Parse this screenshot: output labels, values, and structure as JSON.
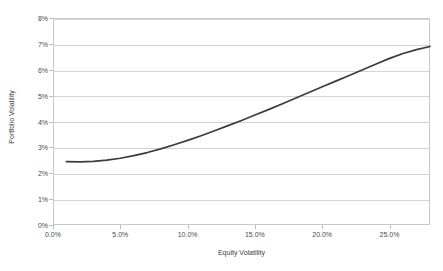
{
  "chart_data": {
    "type": "line",
    "title": "",
    "subtitle": "",
    "xlabel": "Equity Volatility",
    "ylabel": "Portfolio Volatility",
    "xlim": [
      0.0,
      28.0
    ],
    "ylim": [
      0,
      8
    ],
    "x_tick_labels": [
      "0.0%",
      "5.0%",
      "10.0%",
      "15.0%",
      "20.0%",
      "25.0%"
    ],
    "x_tick_values": [
      0.0,
      5.0,
      10.0,
      15.0,
      20.0,
      25.0
    ],
    "y_tick_labels": [
      "0%",
      "1%",
      "2%",
      "3%",
      "4%",
      "5%",
      "6%",
      "7%",
      "8%"
    ],
    "y_tick_values": [
      0,
      1,
      2,
      3,
      4,
      5,
      6,
      7,
      8
    ],
    "grid": "horizontal",
    "legend": "none",
    "series": [
      {
        "name": "Portfolio Volatility",
        "color": "#3b3b3b",
        "x": [
          1.0,
          2.0,
          3.0,
          4.0,
          5.0,
          6.0,
          7.0,
          8.0,
          9.0,
          10.0,
          11.0,
          12.0,
          13.0,
          14.0,
          15.0,
          16.0,
          17.0,
          18.0,
          19.0,
          20.0,
          21.0,
          22.0,
          23.0,
          24.0,
          25.0,
          26.0,
          27.0,
          28.0
        ],
        "values": [
          2.45,
          2.44,
          2.46,
          2.51,
          2.58,
          2.68,
          2.8,
          2.94,
          3.1,
          3.27,
          3.45,
          3.64,
          3.84,
          4.04,
          4.25,
          4.46,
          4.68,
          4.9,
          5.12,
          5.34,
          5.56,
          5.78,
          6.0,
          6.22,
          6.44,
          6.63,
          6.78,
          6.9
        ]
      }
    ],
    "annotations": []
  },
  "axes": {
    "y_title": "Portfolio Volatility",
    "x_title": "Equity Volatility"
  },
  "style": {
    "line_color": "#3b3b3b",
    "grid_color": "#d4d4d4",
    "frame_color": "#c9c9c9",
    "tick_label_color": "#4a4a4a",
    "background": "#ffffff"
  }
}
